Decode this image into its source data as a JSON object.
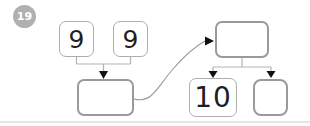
{
  "badge": {
    "label": "19",
    "bg": "#b0b0b0",
    "text_color": "#ffffff"
  },
  "left_group": {
    "addend_boxes": [
      {
        "value": "9"
      },
      {
        "value": "9"
      }
    ],
    "sum_box": {
      "value": ""
    }
  },
  "right_group": {
    "total_box": {
      "value": ""
    },
    "part_boxes": [
      {
        "value": "10"
      },
      {
        "value": ""
      }
    ]
  },
  "colors": {
    "given_box_border": "#adadad",
    "answer_box_border": "#9a9a9a",
    "connector_line": "#b3b3b3",
    "curve_line": "#999999",
    "arrowhead": "#111111",
    "digit": "#1f1f1f",
    "divider": "#e4e4e4"
  }
}
